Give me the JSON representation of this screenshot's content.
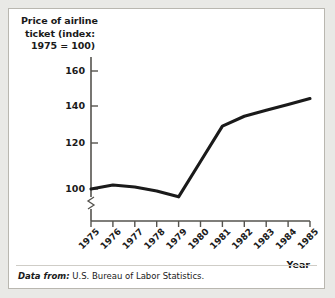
{
  "figure": {
    "title_lines": [
      "Price of airline",
      "ticket (index:",
      "1975 = 100)"
    ],
    "source_lead": "Data from:",
    "source_body": "U.S. Bureau of Labor Statistics.",
    "line_color": "#1a1a1a",
    "axis_color": "#55534e",
    "background": "#ffffff"
  },
  "chart_data": {
    "type": "line",
    "title": "Price of airline ticket (index: 1975 = 100)",
    "xlabel": "Year",
    "ylabel": "Price of airline ticket (index: 1975 = 100)",
    "categories": [
      "1975",
      "1976",
      "1977",
      "1978",
      "1979",
      "1980",
      "1981",
      "1982",
      "1983",
      "1984",
      "1985"
    ],
    "x": [
      1975,
      1976,
      1977,
      1978,
      1979,
      1980,
      1981,
      1982,
      1983,
      1984,
      1985
    ],
    "values": [
      100,
      102,
      101,
      99,
      96,
      114,
      132,
      137,
      140,
      143,
      146
    ],
    "series": [
      {
        "name": "Price of airline ticket (index: 1975 = 100)",
        "values": [
          100,
          102,
          101,
          99,
          96,
          114,
          132,
          137,
          140,
          143,
          146
        ]
      }
    ],
    "ytick_labels": [
      "100",
      "120",
      "140",
      "160"
    ],
    "yticks": [
      100,
      120,
      140,
      160
    ],
    "ylim": [
      88,
      168
    ],
    "xlim": [
      1975,
      1985
    ],
    "grid": false,
    "legend": "none",
    "y_axis_break": true
  }
}
